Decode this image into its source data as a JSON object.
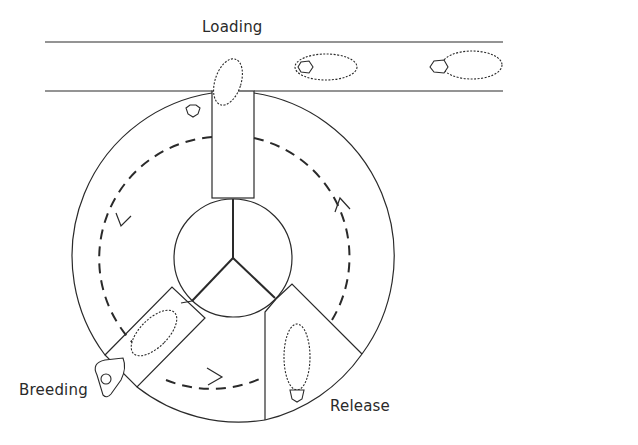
{
  "diagram": {
    "type": "rotary sheep handling / breeding facility",
    "labels": {
      "loading": "Loading",
      "breeding": "Breeding",
      "release": "Release"
    },
    "stations": [
      "Loading",
      "Breeding",
      "Release"
    ],
    "rotation_direction": "counter-clockwise (dashed path with arrows)",
    "sheep_count": 5,
    "colors": {
      "line": "#2a2a2a",
      "background": "#ffffff"
    }
  }
}
